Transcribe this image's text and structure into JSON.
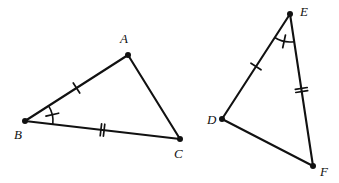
{
  "figure": {
    "background_color": "#ffffff",
    "stroke_color": "#111111",
    "width": 339,
    "height": 183
  },
  "triangles": [
    {
      "id": "triangle-abc",
      "name": "Triangle ABC",
      "vertices": [
        {
          "label": "A",
          "x": 128,
          "y": 55,
          "label_x": 120,
          "label_y": 43
        },
        {
          "label": "B",
          "x": 25,
          "y": 121,
          "label_x": 14,
          "label_y": 139
        },
        {
          "label": "C",
          "x": 180,
          "y": 139,
          "label_x": 174,
          "label_y": 158
        }
      ],
      "sides": [
        {
          "name": "side-AB",
          "from": "A",
          "to": "B",
          "ticks": 1
        },
        {
          "name": "side-BC",
          "from": "B",
          "to": "C",
          "ticks": 2
        },
        {
          "name": "side-AC",
          "from": "A",
          "to": "C",
          "ticks": 0
        }
      ],
      "angles": [
        {
          "name": "angle-B",
          "at": "B",
          "arcs": 1,
          "tick": true
        }
      ]
    },
    {
      "id": "triangle-def",
      "name": "Triangle DEF",
      "vertices": [
        {
          "label": "D",
          "x": 222,
          "y": 119,
          "label_x": 207,
          "label_y": 124
        },
        {
          "label": "E",
          "x": 290,
          "y": 14,
          "label_x": 300,
          "label_y": 16
        },
        {
          "label": "F",
          "x": 313,
          "y": 166,
          "label_x": 320,
          "label_y": 176
        }
      ],
      "sides": [
        {
          "name": "side-DE",
          "from": "D",
          "to": "E",
          "ticks": 1
        },
        {
          "name": "side-EF",
          "from": "E",
          "to": "F",
          "ticks": 2
        },
        {
          "name": "side-DF",
          "from": "D",
          "to": "F",
          "ticks": 0
        }
      ],
      "angles": [
        {
          "name": "angle-E",
          "at": "E",
          "arcs": 1,
          "tick": true
        }
      ]
    }
  ]
}
